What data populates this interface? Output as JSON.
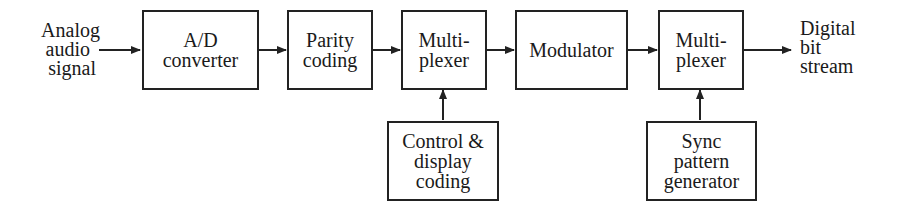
{
  "diagram": {
    "input_label": [
      "Analog",
      "audio",
      "signal"
    ],
    "output_label": [
      "Digital",
      "bit",
      "stream"
    ],
    "blocks": [
      {
        "id": "ad-converter",
        "lines": [
          "A/D",
          "converter"
        ]
      },
      {
        "id": "parity-coding",
        "lines": [
          "Parity",
          "coding"
        ]
      },
      {
        "id": "multiplexer-1",
        "lines": [
          "Multi-",
          "plexer"
        ]
      },
      {
        "id": "modulator",
        "lines": [
          "Modulator"
        ]
      },
      {
        "id": "multiplexer-2",
        "lines": [
          "Multi-",
          "plexer"
        ]
      },
      {
        "id": "control-display-coding",
        "lines": [
          "Control &",
          "display",
          "coding"
        ]
      },
      {
        "id": "sync-pattern-generator",
        "lines": [
          "Sync",
          "pattern",
          "generator"
        ]
      }
    ],
    "connections": [
      {
        "from": "input",
        "to": "ad-converter"
      },
      {
        "from": "ad-converter",
        "to": "parity-coding"
      },
      {
        "from": "parity-coding",
        "to": "multiplexer-1"
      },
      {
        "from": "multiplexer-1",
        "to": "modulator"
      },
      {
        "from": "modulator",
        "to": "multiplexer-2"
      },
      {
        "from": "multiplexer-2",
        "to": "output"
      },
      {
        "from": "control-display-coding",
        "to": "multiplexer-1"
      },
      {
        "from": "sync-pattern-generator",
        "to": "multiplexer-2"
      }
    ]
  }
}
